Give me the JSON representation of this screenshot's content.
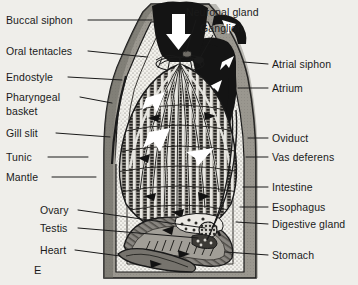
{
  "figure": {
    "panel_letter": "E",
    "background_color": "#efeeea",
    "ink_color": "#1a1a1a"
  },
  "labels_left": [
    {
      "id": "buccal-siphon",
      "text": "Buccal siphon",
      "x": 6,
      "y": 14,
      "line_from_x": 88,
      "line_from_y": 20,
      "line_to_x": 152,
      "line_to_y": 20
    },
    {
      "id": "oral-tentacles",
      "text": "Oral tentacles",
      "x": 6,
      "y": 45,
      "line_from_x": 88,
      "line_from_y": 51,
      "line_to_x": 147,
      "line_to_y": 57
    },
    {
      "id": "endostyle",
      "text": "Endostyle",
      "x": 6,
      "y": 71,
      "line_from_x": 68,
      "line_from_y": 77,
      "line_to_x": 122,
      "line_to_y": 80
    },
    {
      "id": "pharyngeal-basket",
      "text": "Pharyngeal",
      "text2": "basket",
      "x": 6,
      "y": 91,
      "line_from_x": 80,
      "line_from_y": 97,
      "line_to_x": 112,
      "line_to_y": 103
    },
    {
      "id": "gill-slit",
      "text": "Gill slit",
      "x": 6,
      "y": 127,
      "line_from_x": 56,
      "line_from_y": 133,
      "line_to_x": 110,
      "line_to_y": 137
    },
    {
      "id": "tunic",
      "text": "Tunic",
      "x": 6,
      "y": 151,
      "line_from_x": 48,
      "line_from_y": 157,
      "line_to_x": 88,
      "line_to_y": 157
    },
    {
      "id": "mantle",
      "text": "Mantle",
      "x": 6,
      "y": 171,
      "line_from_x": 52,
      "line_from_y": 177,
      "line_to_x": 96,
      "line_to_y": 177
    },
    {
      "id": "ovary",
      "text": "Ovary",
      "x": 40,
      "y": 204,
      "line_from_x": 78,
      "line_from_y": 210,
      "line_to_x": 205,
      "line_to_y": 228
    },
    {
      "id": "testis",
      "text": "Testis",
      "x": 40,
      "y": 222,
      "line_from_x": 78,
      "line_from_y": 228,
      "line_to_x": 198,
      "line_to_y": 238
    },
    {
      "id": "heart",
      "text": "Heart",
      "x": 40,
      "y": 244,
      "line_from_x": 75,
      "line_from_y": 250,
      "line_to_x": 120,
      "line_to_y": 256
    }
  ],
  "labels_top": [
    {
      "id": "neuronal-gland",
      "text": "Neuronal gland",
      "x": 186,
      "y": 6,
      "line_from_x": 196,
      "line_from_y": 20,
      "line_to_x": 186,
      "line_to_y": 52
    },
    {
      "id": "ganglion",
      "text": "Ganglion",
      "x": 200,
      "y": 22,
      "line_from_x": 213,
      "line_from_y": 35,
      "line_to_x": 199,
      "line_to_y": 60
    }
  ],
  "labels_right": [
    {
      "id": "atrial-siphon",
      "text": "Atrial siphon",
      "x": 272,
      "y": 58,
      "line_from_x": 268,
      "line_from_y": 64,
      "line_to_x": 243,
      "line_to_y": 62
    },
    {
      "id": "atrium",
      "text": "Atrium",
      "x": 272,
      "y": 82,
      "line_from_x": 268,
      "line_from_y": 88,
      "line_to_x": 238,
      "line_to_y": 88
    },
    {
      "id": "oviduct",
      "text": "Oviduct",
      "x": 272,
      "y": 132,
      "line_from_x": 268,
      "line_from_y": 138,
      "line_to_x": 248,
      "line_to_y": 138
    },
    {
      "id": "vas-deferens",
      "text": "Vas deferens",
      "x": 272,
      "y": 151,
      "line_from_x": 268,
      "line_from_y": 157,
      "line_to_x": 246,
      "line_to_y": 157
    },
    {
      "id": "intestine",
      "text": "Intestine",
      "x": 272,
      "y": 181,
      "line_from_x": 268,
      "line_from_y": 187,
      "line_to_x": 243,
      "line_to_y": 187
    },
    {
      "id": "esophagus",
      "text": "Esophagus",
      "x": 272,
      "y": 201,
      "line_from_x": 268,
      "line_from_y": 207,
      "line_to_x": 240,
      "line_to_y": 207
    },
    {
      "id": "digestive-gland",
      "text": "Digestive gland",
      "x": 272,
      "y": 218,
      "line_from_x": 268,
      "line_from_y": 224,
      "line_to_x": 236,
      "line_to_y": 222
    },
    {
      "id": "stomach",
      "text": "Stomach",
      "x": 272,
      "y": 249,
      "line_from_x": 268,
      "line_from_y": 255,
      "line_to_x": 225,
      "line_to_y": 252
    }
  ],
  "palette": {
    "tunic_gray": "#9a978f",
    "tunic_dark_edge": "#4a4844",
    "mantle_white": "#f2f1ec",
    "cavity_black": "#141414",
    "pharynx_mid": "#6f6d66",
    "pharynx_dark": "#3a3834",
    "organ_gray": "#807d76",
    "arrow_white": "#ffffff",
    "outline": "#1a1a1a"
  }
}
